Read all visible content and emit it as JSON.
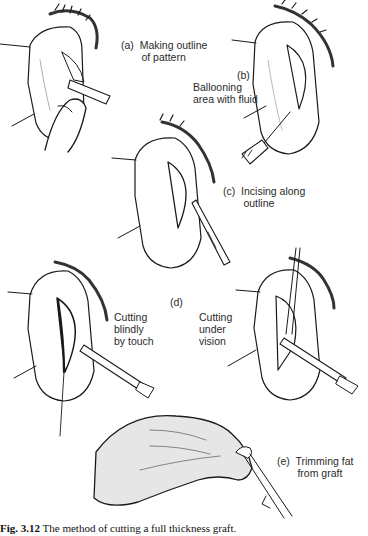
{
  "figure": {
    "panels": [
      {
        "id": "a",
        "label": "(a)  Making outline\n       of pattern"
      },
      {
        "id": "b",
        "label_letter": "(b)",
        "label": "Ballooning\narea with fluid"
      },
      {
        "id": "c",
        "label": "(c)  Incising along\n       outline"
      },
      {
        "id": "d",
        "label_letter": "(d)",
        "left_label": "Cutting\nblindly\nby touch",
        "right_label": "Cutting\nunder\nvision"
      },
      {
        "id": "e",
        "label": "(e)  Trimming fat\n       from graft"
      }
    ],
    "caption": {
      "number": "Fig. 3.12",
      "text": " The method of cutting a full thickness graft."
    },
    "colors": {
      "ink": "#1a1a1a",
      "shade": "#bdbdbd",
      "background": "#ffffff"
    }
  }
}
